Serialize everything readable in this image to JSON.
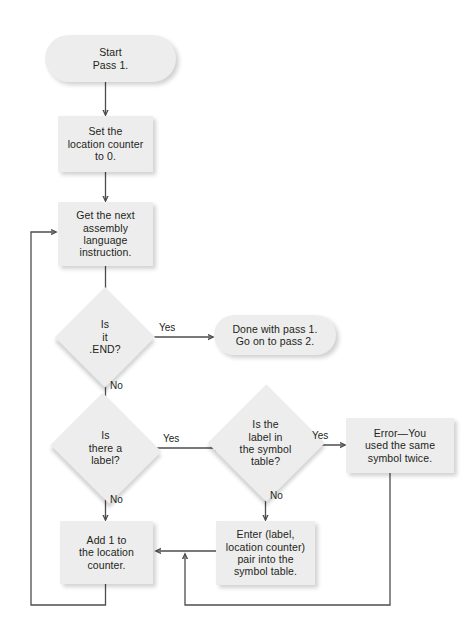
{
  "diagram": {
    "type": "flowchart",
    "background_color": "#ffffff",
    "node_fill_color": "#ededed",
    "text_color": "#231f20",
    "line_color": "#4d4d4f"
  },
  "nodes": {
    "start": {
      "label": "Start\nPass 1.",
      "shape": "stadium"
    },
    "set_counter": {
      "label": "Set the\nlocation counter\nto 0.",
      "shape": "rect"
    },
    "get_next": {
      "label": "Get the next\nassembly\nlanguage\ninstruction.",
      "shape": "rect"
    },
    "is_end": {
      "label": "Is\nit\n.END?",
      "shape": "diamond"
    },
    "done": {
      "label": "Done with pass 1.\nGo on to pass 2.",
      "shape": "stadium"
    },
    "is_label": {
      "label": "Is\nthere a\nlabel?",
      "shape": "diamond"
    },
    "in_table": {
      "label": "Is the\nlabel in\nthe symbol\ntable?",
      "shape": "diamond"
    },
    "error": {
      "label": "Error—You\nused the same\nsymbol twice.",
      "shape": "rect"
    },
    "add_one": {
      "label": "Add 1 to\nthe location\ncounter.",
      "shape": "rect"
    },
    "enter_pair": {
      "label": "Enter (label,\nlocation counter)\npair into the\nsymbol table.",
      "shape": "rect"
    }
  },
  "edge_labels": {
    "end_yes": "Yes",
    "end_no": "No",
    "label_yes": "Yes",
    "label_no": "No",
    "table_yes": "Yes",
    "table_no": "No"
  },
  "edges": [
    {
      "from": "start",
      "to": "set_counter",
      "label": ""
    },
    {
      "from": "set_counter",
      "to": "get_next",
      "label": ""
    },
    {
      "from": "get_next",
      "to": "is_end",
      "label": ""
    },
    {
      "from": "is_end",
      "to": "done",
      "label": "Yes"
    },
    {
      "from": "is_end",
      "to": "is_label",
      "label": "No"
    },
    {
      "from": "is_label",
      "to": "in_table",
      "label": "Yes"
    },
    {
      "from": "is_label",
      "to": "add_one",
      "label": "No"
    },
    {
      "from": "in_table",
      "to": "error",
      "label": "Yes"
    },
    {
      "from": "in_table",
      "to": "enter_pair",
      "label": "No"
    },
    {
      "from": "enter_pair",
      "to": "add_one",
      "label": ""
    },
    {
      "from": "add_one",
      "to": "get_next",
      "label": ""
    },
    {
      "from": "error",
      "to": "enter_pair",
      "label": ""
    }
  ]
}
